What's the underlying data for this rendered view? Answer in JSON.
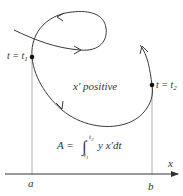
{
  "diagram": {
    "labels": {
      "t1": "t = t",
      "t1_sub": "1",
      "t2": "t = t",
      "t2_sub": "2",
      "region": "x′  positive",
      "formula_lhs": "A = ",
      "formula_upper": "t",
      "formula_upper_sub": "2",
      "formula_lower": "t",
      "formula_lower_sub": "1",
      "formula_body": "y x′dt",
      "axis_x": "x",
      "a": "a",
      "b": "b"
    },
    "colors": {
      "curve": "#3a3a3a",
      "guide": "#9a9a9a",
      "axis": "#333333"
    }
  }
}
